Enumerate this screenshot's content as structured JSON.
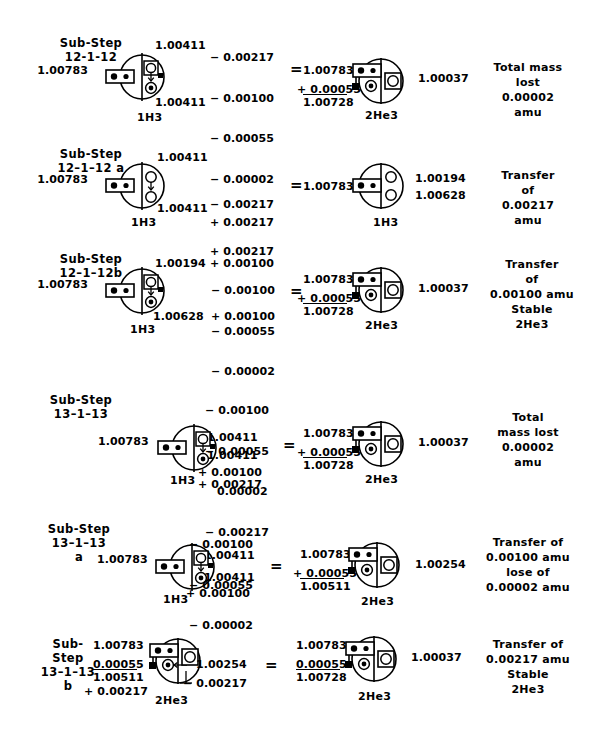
{
  "document": {
    "type": "nuclear-transmutation-diagram",
    "ink_color": "#000000",
    "background": "#ffffff"
  },
  "rows": [
    {
      "id": "12-1-12",
      "step_label": "Sub-Step\n12-1-12",
      "left_mass": "1.00783",
      "left_atom_top": "1.00411",
      "left_atom_bottom": "1.00411",
      "left_isotope": "1H3",
      "operations": [
        "− 0.00217",
        "− 0.00100",
        "− 0.00055",
        "− 0.00002",
        "+ 0.00217",
        "+ 0.00100"
      ],
      "equals": "=",
      "right_sum_a": "1.00783",
      "right_sum_b": "+ 0.00055",
      "right_sum_total": "1.00728",
      "right_value": "1.00037",
      "right_isotope": "2He3",
      "note": "Total mass\nlost\n0.00002\namu"
    },
    {
      "id": "12-1-12a",
      "step_label": "Sub-Step\n12–1–12 a",
      "left_mass": "1.00783",
      "left_atom_top": "1.00411",
      "left_atom_bottom": "1.00411",
      "left_isotope": "1H3",
      "operations": [
        "− 0.00217",
        "+ 0.00217"
      ],
      "equals": "=",
      "right_mass": "1.00783",
      "right_value_a": "1.00194",
      "right_value_b": "1.00628",
      "right_isotope": "1H3",
      "note": "Transfer\nof\n0.00217\namu"
    },
    {
      "id": "12-1-12b",
      "step_label": "Sub-Step\n12–1–12b",
      "left_mass": "1.00783",
      "left_atom_top": "1.00194",
      "left_atom_bottom": "1.00628",
      "left_isotope": "1H3",
      "operations": [
        "− 0.00100",
        "− 0.00055",
        "− 0.00002",
        "+ 0.00100"
      ],
      "equals": "=",
      "right_sum_a": "1.00783",
      "right_sum_b": "+ 0.00055",
      "right_sum_total": "1.00728",
      "right_value": "1.00037",
      "right_isotope": "2He3",
      "note": "Transfer\nof\n0.00100 amu\nStable\n2He3"
    },
    {
      "id": "13-1-13",
      "step_label": "Sub-Step\n13–1–13",
      "left_mass": "1.00783",
      "left_atom_top": "1.00411",
      "left_atom_bottom": "1.00411",
      "left_isotope": "1H3",
      "operations": [
        "− 0.00100",
        "− 0.00055",
        "0.00002",
        "− 0.00217",
        "+ 0.00100",
        "+ 0.00217"
      ],
      "equals": "=",
      "right_sum_a": "1.00783",
      "right_sum_b": "+ 0.00055",
      "right_sum_total": "1.00728",
      "right_value": "1.00037",
      "right_isotope": "2He3",
      "note": "Total\nmass lost\n0.00002\namu"
    },
    {
      "id": "13-1-13a",
      "step_label": "Sub-Step\n13–1–13\na",
      "left_mass": "1.00783",
      "left_atom_top": "1.00411",
      "left_atom_bottom": "1.00411",
      "left_isotope": "1H3",
      "operations": [
        "− 0.00100",
        "− 0.00055",
        "− 0.00002",
        "+ 0.00100"
      ],
      "equals": "=",
      "right_sum_a": "1.00783",
      "right_sum_b": "+ 0.00055",
      "right_sum_total": "1.00511",
      "right_value": "1.00254",
      "right_isotope": "2He3",
      "note": "Transfer of\n0.00100 amu\nlose of\n0.00002 amu"
    },
    {
      "id": "13-1-13b",
      "step_label": "Sub-\nStep\n13–1–13\nb",
      "left_sum_a": "1.00783",
      "left_sum_b": "0.00055",
      "left_sum_total": "1.00511",
      "left_sum_add": "+ 0.00217",
      "left_atom_value": "1.00254",
      "left_operation": "− 0.00217",
      "left_isotope": "2He3",
      "equals": "=",
      "right_sum_a": "1.00783",
      "right_sum_b": "0.00055",
      "right_sum_total": "1.00728",
      "right_value": "1.00037",
      "right_isotope": "2He3",
      "note": "Transfer of\n0.00217 amu\nStable\n2He3"
    }
  ]
}
